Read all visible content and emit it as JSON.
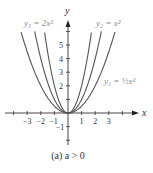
{
  "chart_data": {
    "type": "line",
    "title": "",
    "caption": "(a) a > 0",
    "xlabel": "x",
    "ylabel": "y",
    "xlim": [
      -4.5,
      5
    ],
    "ylim": [
      -2.2,
      6.5
    ],
    "x_ticks": [
      -3,
      -2,
      -1,
      1,
      2,
      3
    ],
    "x_tick_labels": [
      "−3",
      "−2",
      "−1",
      "1",
      "2",
      "3"
    ],
    "y_ticks": [
      1,
      2,
      3,
      4,
      5
    ],
    "y_tick_labels": [
      "2",
      "3",
      "4",
      "5"
    ],
    "y_neg_label": "−1",
    "grid": false,
    "series": [
      {
        "name": "y1 = (1/2)x^2",
        "label_main": "y",
        "label_sub": "1",
        "label_rest": " = ",
        "label_frac": "1/2",
        "label_tail": "x",
        "coef": 0.5,
        "x_range": [
          -3.45,
          3.45
        ]
      },
      {
        "name": "y2 = x^2",
        "label_main": "y",
        "label_sub": "2",
        "label_rest": " = x",
        "coef": 1,
        "x_range": [
          -2.45,
          2.45
        ]
      },
      {
        "name": "y3 = 2x^2",
        "label_main": "y",
        "label_sub": "3",
        "label_rest": " = 2x",
        "coef": 2,
        "x_range": [
          -1.72,
          1.72
        ]
      }
    ],
    "colors": {
      "curve": "#555555",
      "axis": "#333333",
      "label": "#8a8a8a"
    }
  },
  "labels": {
    "x_axis": "x",
    "y_axis": "y",
    "y1": "y₁ = ½x²",
    "y2": "y₂ = x²",
    "y3": "y₃ = 2x²",
    "caption": "(a) a > 0",
    "xt": [
      "−3",
      "−2",
      "−1",
      "1",
      "2",
      "3"
    ],
    "yt": [
      "2",
      "3",
      "4",
      "5"
    ],
    "yneg": "−1"
  }
}
